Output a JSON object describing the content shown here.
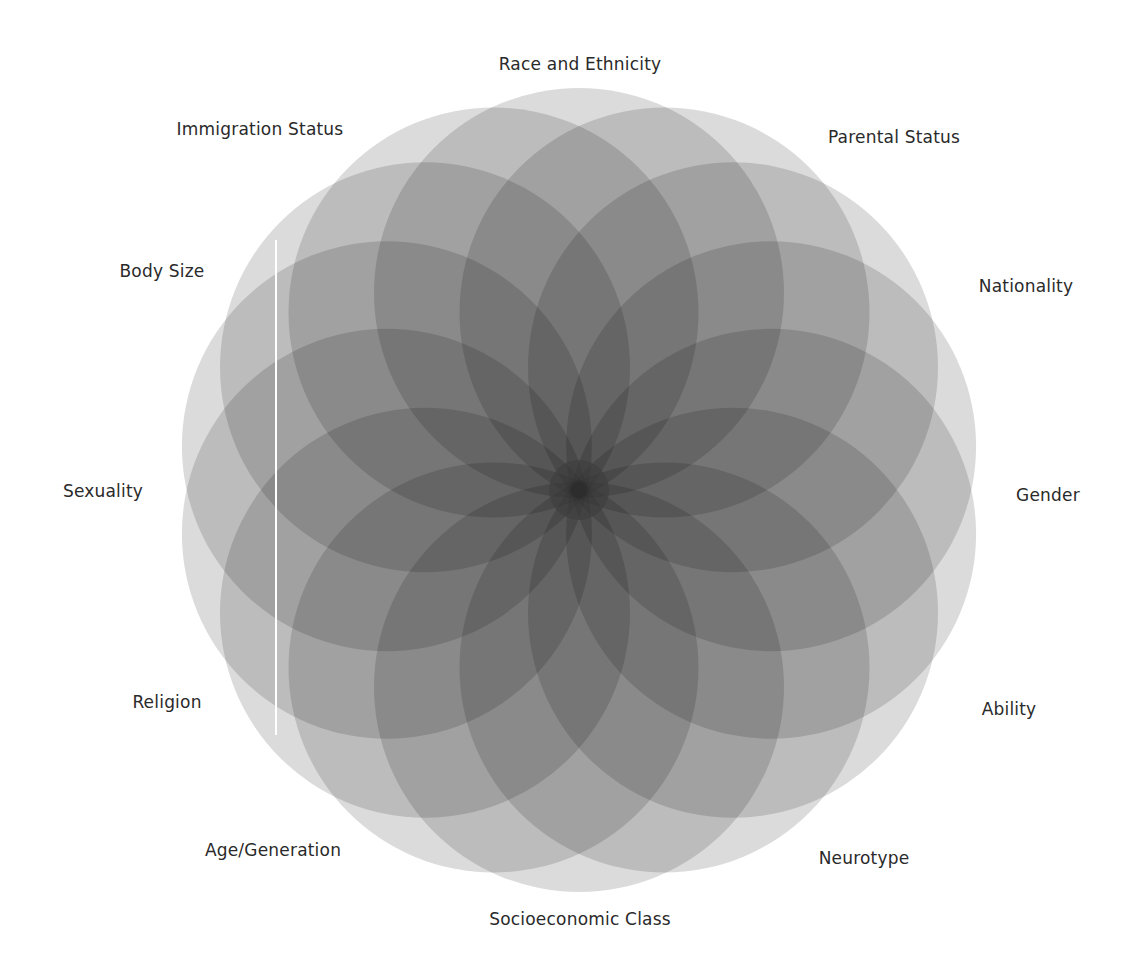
{
  "diagram": {
    "type": "overlapping-circles-flower",
    "center": [
      579,
      490
    ],
    "circle_count": 14,
    "circle_radius": 205,
    "center_offset": 197,
    "circle_fill": "#000000",
    "circle_opacity": 0.14,
    "core_color": "#3c3c3c",
    "divider_line": {
      "x": 276,
      "y1": 240,
      "y2": 735,
      "color": "#ffffff"
    }
  },
  "labels": [
    {
      "text": "Race and Ethnicity",
      "x": 580,
      "y": 64
    },
    {
      "text": "Parental Status",
      "x": 894,
      "y": 137
    },
    {
      "text": "Nationality",
      "x": 1026,
      "y": 286
    },
    {
      "text": "Gender",
      "x": 1048,
      "y": 495
    },
    {
      "text": "Ability",
      "x": 1009,
      "y": 709
    },
    {
      "text": "Neurotype",
      "x": 864,
      "y": 858
    },
    {
      "text": "Socioeconomic Class",
      "x": 580,
      "y": 919
    },
    {
      "text": "Age/Generation",
      "x": 273,
      "y": 850
    },
    {
      "text": "Religion",
      "x": 167,
      "y": 702
    },
    {
      "text": "Sexuality",
      "x": 103,
      "y": 491
    },
    {
      "text": "Body Size",
      "x": 162,
      "y": 271
    },
    {
      "text": "Immigration Status",
      "x": 260,
      "y": 129
    }
  ]
}
